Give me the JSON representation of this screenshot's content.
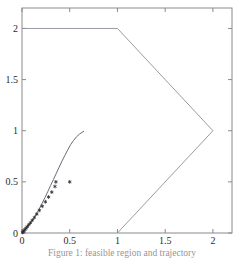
{
  "figure": {
    "background": "#ffffff",
    "axis_color": "#8a8a8a",
    "curve_color": "#5a5a6a",
    "polygon_color": "#8f8f97",
    "marker_color": "#2a2a2a",
    "tick_label_color": "#2b2b2b"
  },
  "caption": {
    "text": "Figure 1: feasible region and trajectory"
  },
  "chart_data": {
    "type": "line",
    "title": "",
    "xlabel": "",
    "ylabel": "",
    "xlim": [
      0,
      2.2
    ],
    "ylim": [
      0,
      2.2
    ],
    "grid": false,
    "legend": "none",
    "xticks": [
      0,
      0.5,
      1,
      1.5,
      2
    ],
    "xticklabels": [
      "0",
      "0.5",
      "1",
      "1.5",
      "2"
    ],
    "yticks": [
      0,
      0.5,
      1,
      1.5,
      2
    ],
    "yticklabels": [
      "0",
      "0.5",
      "1",
      "1.5",
      "2"
    ],
    "series": [
      {
        "name": "feasible-region-boundary",
        "type": "line",
        "style": "solid",
        "closed": false,
        "points": [
          [
            0,
            2
          ],
          [
            1,
            2
          ],
          [
            2,
            1
          ],
          [
            1,
            0
          ]
        ]
      },
      {
        "name": "trajectory-curve",
        "type": "line",
        "style": "solid",
        "closed": false,
        "points": [
          [
            0.0,
            0.0
          ],
          [
            0.03,
            0.03
          ],
          [
            0.06,
            0.065
          ],
          [
            0.09,
            0.1
          ],
          [
            0.12,
            0.14
          ],
          [
            0.15,
            0.185
          ],
          [
            0.18,
            0.235
          ],
          [
            0.21,
            0.29
          ],
          [
            0.24,
            0.345
          ],
          [
            0.27,
            0.405
          ],
          [
            0.3,
            0.465
          ],
          [
            0.33,
            0.525
          ],
          [
            0.36,
            0.585
          ],
          [
            0.39,
            0.645
          ],
          [
            0.42,
            0.705
          ],
          [
            0.45,
            0.76
          ],
          [
            0.48,
            0.815
          ],
          [
            0.51,
            0.865
          ],
          [
            0.54,
            0.905
          ],
          [
            0.57,
            0.94
          ],
          [
            0.6,
            0.965
          ],
          [
            0.63,
            0.985
          ],
          [
            0.65,
            0.995
          ]
        ]
      },
      {
        "name": "iterate-markers",
        "type": "scatter",
        "marker": "asterisk",
        "points": [
          [
            0.005,
            0.005
          ],
          [
            0.012,
            0.013
          ],
          [
            0.02,
            0.022
          ],
          [
            0.03,
            0.033
          ],
          [
            0.042,
            0.047
          ],
          [
            0.055,
            0.062
          ],
          [
            0.07,
            0.08
          ],
          [
            0.088,
            0.1
          ],
          [
            0.108,
            0.125
          ],
          [
            0.13,
            0.152
          ],
          [
            0.155,
            0.185
          ],
          [
            0.182,
            0.222
          ],
          [
            0.212,
            0.262
          ],
          [
            0.245,
            0.305
          ],
          [
            0.278,
            0.352
          ],
          [
            0.312,
            0.4
          ],
          [
            0.345,
            0.455
          ],
          [
            0.355,
            0.5
          ],
          [
            0.5,
            0.5
          ]
        ]
      }
    ]
  }
}
